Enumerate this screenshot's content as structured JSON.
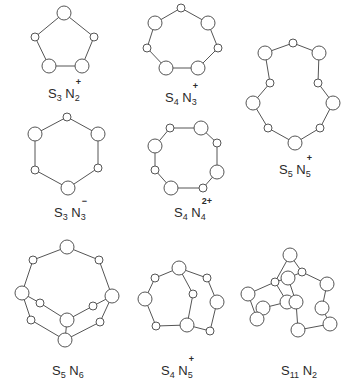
{
  "figure": {
    "stroke_color": "#555555",
    "atom_fill": "#ffffff",
    "structures": [
      {
        "id": "s3n2",
        "label": {
          "s": "S",
          "s_count": "3",
          "n": "N",
          "n_count": "2",
          "charge": "+"
        },
        "label_pos": [
          48,
          86
        ],
        "atoms": [
          [
            64,
            13,
            7
          ],
          [
            35,
            37,
            4
          ],
          [
            94,
            37,
            4
          ],
          [
            49,
            66,
            7
          ],
          [
            82,
            66,
            7
          ]
        ],
        "bonds": [
          [
            0,
            1
          ],
          [
            0,
            2
          ],
          [
            1,
            3
          ],
          [
            2,
            4
          ],
          [
            3,
            4
          ]
        ]
      },
      {
        "id": "s4n3",
        "label": {
          "s": "S",
          "s_count": "4",
          "n": "N",
          "n_count": "3",
          "charge": "+"
        },
        "label_pos": [
          165,
          90
        ],
        "atoms": [
          [
            181,
            8,
            4
          ],
          [
            155,
            23,
            7
          ],
          [
            208,
            23,
            7
          ],
          [
            147,
            48,
            4
          ],
          [
            218,
            48,
            4
          ],
          [
            166,
            68,
            7
          ],
          [
            198,
            68,
            7
          ]
        ],
        "bonds": [
          [
            0,
            1
          ],
          [
            0,
            2
          ],
          [
            1,
            3
          ],
          [
            2,
            4
          ],
          [
            3,
            5
          ],
          [
            4,
            6
          ],
          [
            5,
            6
          ]
        ]
      },
      {
        "id": "s5n5",
        "label": {
          "s": "S",
          "s_count": "5",
          "n": "N",
          "n_count": "5",
          "charge": "+"
        },
        "label_pos": [
          279,
          162
        ],
        "atoms": [
          [
            293,
            43,
            4
          ],
          [
            265,
            53,
            7
          ],
          [
            319,
            53,
            7
          ],
          [
            270,
            83,
            4
          ],
          [
            318,
            83,
            4
          ],
          [
            253,
            103,
            7
          ],
          [
            333,
            103,
            7
          ],
          [
            268,
            128,
            4
          ],
          [
            320,
            128,
            4
          ],
          [
            295,
            143,
            7
          ]
        ],
        "bonds": [
          [
            0,
            1
          ],
          [
            0,
            2
          ],
          [
            1,
            3
          ],
          [
            2,
            4
          ],
          [
            3,
            5
          ],
          [
            4,
            6
          ],
          [
            5,
            7
          ],
          [
            6,
            8
          ],
          [
            7,
            9
          ],
          [
            8,
            9
          ]
        ]
      },
      {
        "id": "s3n3",
        "label": {
          "s": "S",
          "s_count": "3",
          "n": "N",
          "n_count": "3",
          "charge": "−"
        },
        "label_pos": [
          54,
          205
        ],
        "atoms": [
          [
            67,
            117,
            4
          ],
          [
            35,
            134,
            7
          ],
          [
            98,
            134,
            7
          ],
          [
            35,
            170,
            4
          ],
          [
            98,
            168,
            4
          ],
          [
            68,
            188,
            7
          ]
        ],
        "bonds": [
          [
            0,
            1
          ],
          [
            0,
            2
          ],
          [
            1,
            3
          ],
          [
            2,
            4
          ],
          [
            3,
            5
          ],
          [
            4,
            5
          ]
        ]
      },
      {
        "id": "s4n4",
        "label": {
          "s": "S",
          "s_count": "4",
          "n": "N",
          "n_count": "4",
          "charge": "2+"
        },
        "label_pos": [
          174,
          205
        ],
        "atoms": [
          [
            170,
            128,
            4
          ],
          [
            201,
            128,
            7
          ],
          [
            155,
            146,
            7
          ],
          [
            217,
            143,
            4
          ],
          [
            155,
            170,
            4
          ],
          [
            217,
            172,
            7
          ],
          [
            171,
            188,
            7
          ],
          [
            203,
            188,
            4
          ]
        ],
        "bonds": [
          [
            0,
            1
          ],
          [
            0,
            2
          ],
          [
            1,
            3
          ],
          [
            2,
            4
          ],
          [
            3,
            5
          ],
          [
            4,
            6
          ],
          [
            5,
            7
          ],
          [
            6,
            7
          ]
        ]
      },
      {
        "id": "s5n6",
        "label": {
          "s": "S",
          "s_count": "5",
          "n": "N",
          "n_count": "6",
          "charge": ""
        },
        "label_pos": [
          52,
          363
        ],
        "atoms": [
          [
            67,
            247,
            7
          ],
          [
            33,
            260,
            4
          ],
          [
            99,
            260,
            4
          ],
          [
            22,
            293,
            7
          ],
          [
            112,
            296,
            7
          ],
          [
            40,
            303,
            4
          ],
          [
            93,
            306,
            4
          ],
          [
            67,
            320,
            7
          ],
          [
            31,
            320,
            4
          ],
          [
            100,
            322,
            4
          ],
          [
            65,
            340,
            7
          ]
        ],
        "bonds": [
          [
            0,
            1
          ],
          [
            0,
            2
          ],
          [
            1,
            3
          ],
          [
            2,
            4
          ],
          [
            3,
            5
          ],
          [
            4,
            6
          ],
          [
            5,
            7
          ],
          [
            6,
            7
          ],
          [
            3,
            8
          ],
          [
            4,
            9
          ],
          [
            8,
            10
          ],
          [
            9,
            10
          ],
          [
            7,
            10
          ]
        ]
      },
      {
        "id": "s4n5",
        "label": {
          "s": "S",
          "s_count": "4",
          "n": "N",
          "n_count": "5",
          "charge": "+"
        },
        "label_pos": [
          161,
          363
        ],
        "atoms": [
          [
            179,
            268,
            7
          ],
          [
            155,
            278,
            4
          ],
          [
            207,
            278,
            4
          ],
          [
            145,
            299,
            7
          ],
          [
            193,
            294,
            4
          ],
          [
            217,
            302,
            7
          ],
          [
            156,
            326,
            4
          ],
          [
            187,
            325,
            7
          ],
          [
            210,
            331,
            4
          ]
        ],
        "bonds": [
          [
            0,
            1
          ],
          [
            0,
            2
          ],
          [
            0,
            4
          ],
          [
            1,
            3
          ],
          [
            3,
            6
          ],
          [
            6,
            7
          ],
          [
            4,
            7
          ],
          [
            2,
            5
          ],
          [
            5,
            8
          ],
          [
            7,
            8
          ]
        ]
      },
      {
        "id": "s11n2",
        "label": {
          "s": "S",
          "s_count": "11",
          "n": "N",
          "n_count": "2",
          "charge": ""
        },
        "label_pos": [
          281,
          363
        ],
        "atoms": [
          [
            290,
            255,
            7
          ],
          [
            302,
            272,
            4
          ],
          [
            288,
            278,
            7
          ],
          [
            275,
            282,
            4
          ],
          [
            327,
            284,
            7
          ],
          [
            248,
            294,
            7
          ],
          [
            287,
            302,
            7
          ],
          [
            296,
            302,
            7
          ],
          [
            263,
            308,
            7
          ],
          [
            322,
            308,
            7
          ],
          [
            257,
            319,
            7
          ],
          [
            330,
            324,
            7
          ],
          [
            298,
            330,
            7
          ]
        ],
        "bonds": [
          [
            0,
            1
          ],
          [
            0,
            3
          ],
          [
            1,
            2
          ],
          [
            1,
            4
          ],
          [
            3,
            2
          ],
          [
            3,
            5
          ],
          [
            3,
            6
          ],
          [
            5,
            10
          ],
          [
            6,
            8
          ],
          [
            8,
            10
          ],
          [
            7,
            12
          ],
          [
            4,
            9
          ],
          [
            9,
            11
          ],
          [
            11,
            12
          ],
          [
            2,
            7
          ]
        ]
      }
    ]
  }
}
